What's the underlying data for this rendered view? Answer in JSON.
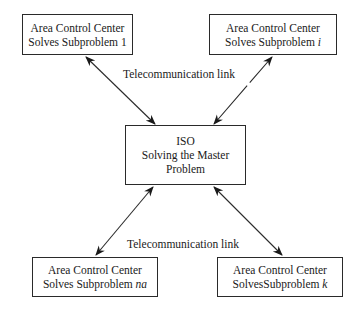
{
  "diagram": {
    "nodes": {
      "sub1": {
        "line1": "Area Control Center",
        "line2_prefix": "Solves Subproblem ",
        "line2_var": "1"
      },
      "subi": {
        "line1": "Area Control Center",
        "line2_prefix": "Solves Subproblem ",
        "line2_var": "i"
      },
      "iso": {
        "line1": "ISO",
        "line2": "Solving the Master",
        "line3": "Problem"
      },
      "subna": {
        "line1": "Area Control Center",
        "line2_prefix": "Solves Subproblem ",
        "line2_var": "na"
      },
      "subk": {
        "line1": "Area Control Center",
        "line2_prefix": "SolvesSubproblem ",
        "line2_var": "k"
      }
    },
    "edge_labels": {
      "top": "Telecommunication link",
      "bottom": "Telecommunication link"
    },
    "edges": [
      {
        "from": "sub1",
        "to": "iso",
        "type": "bidirectional"
      },
      {
        "from": "subi",
        "to": "iso",
        "type": "bidirectional"
      },
      {
        "from": "subna",
        "to": "iso",
        "type": "bidirectional"
      },
      {
        "from": "subk",
        "to": "iso",
        "type": "bidirectional"
      }
    ],
    "colors": {
      "line": "#2a2a2a",
      "background": "#ffffff"
    }
  }
}
